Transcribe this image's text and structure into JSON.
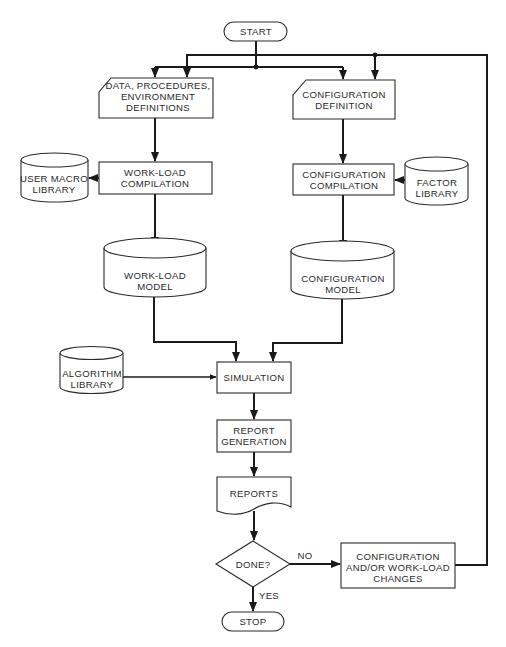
{
  "diagram": {
    "type": "flowchart",
    "colors": {
      "line": "#1a1a1a",
      "text": "#2a2a2a",
      "background": "#ffffff"
    },
    "nodes": {
      "start": {
        "shape": "terminal",
        "lines": [
          "START"
        ]
      },
      "data_definitions": {
        "shape": "card",
        "lines": [
          "DATA, PROCEDURES,",
          "ENVIRONMENT",
          "DEFINITIONS"
        ]
      },
      "configuration_definition": {
        "shape": "card",
        "lines": [
          "CONFIGURATION",
          "DEFINITION"
        ]
      },
      "user_macro_library": {
        "shape": "cylinder",
        "lines": [
          "USER MACRO",
          "LIBRARY"
        ]
      },
      "workload_compilation": {
        "shape": "process",
        "lines": [
          "WORK-LOAD",
          "COMPILATION"
        ]
      },
      "configuration_compilation": {
        "shape": "process",
        "lines": [
          "CONFIGURATION",
          "COMPILATION"
        ]
      },
      "factor_library": {
        "shape": "cylinder",
        "lines": [
          "FACTOR",
          "LIBRARY"
        ]
      },
      "workload_model": {
        "shape": "cylinder",
        "lines": [
          "WORK-LOAD",
          "MODEL"
        ]
      },
      "configuration_model": {
        "shape": "cylinder",
        "lines": [
          "CONFIGURATION",
          "MODEL"
        ]
      },
      "algorithm_library": {
        "shape": "cylinder",
        "lines": [
          "ALGORITHM",
          "LIBRARY"
        ]
      },
      "simulation": {
        "shape": "process",
        "lines": [
          "SIMULATION"
        ]
      },
      "report_generation": {
        "shape": "process",
        "lines": [
          "REPORT",
          "GENERATION"
        ]
      },
      "reports": {
        "shape": "document",
        "lines": [
          "REPORTS"
        ]
      },
      "done": {
        "shape": "decision",
        "lines": [
          "DONE?"
        ]
      },
      "changes": {
        "shape": "process",
        "lines": [
          "CONFIGURATION",
          "AND/OR WORK-LOAD",
          "CHANGES"
        ]
      },
      "stop": {
        "shape": "terminal",
        "lines": [
          "STOP"
        ]
      }
    },
    "edge_labels": {
      "no": "NO",
      "yes": "YES"
    },
    "edges": [
      {
        "from": "start",
        "to": "data_definitions"
      },
      {
        "from": "start",
        "to": "configuration_definition"
      },
      {
        "from": "changes",
        "to": "data_definitions",
        "label": ""
      },
      {
        "from": "changes",
        "to": "configuration_definition",
        "label": ""
      },
      {
        "from": "data_definitions",
        "to": "workload_compilation"
      },
      {
        "from": "workload_compilation",
        "to": "user_macro_library"
      },
      {
        "from": "workload_compilation",
        "to": "workload_model"
      },
      {
        "from": "configuration_definition",
        "to": "configuration_compilation"
      },
      {
        "from": "factor_library",
        "to": "configuration_compilation"
      },
      {
        "from": "configuration_compilation",
        "to": "configuration_model"
      },
      {
        "from": "workload_model",
        "to": "simulation"
      },
      {
        "from": "configuration_model",
        "to": "simulation"
      },
      {
        "from": "algorithm_library",
        "to": "simulation"
      },
      {
        "from": "simulation",
        "to": "report_generation"
      },
      {
        "from": "report_generation",
        "to": "reports"
      },
      {
        "from": "reports",
        "to": "done"
      },
      {
        "from": "done",
        "to": "changes",
        "label": "NO"
      },
      {
        "from": "done",
        "to": "stop",
        "label": "YES"
      }
    ]
  }
}
